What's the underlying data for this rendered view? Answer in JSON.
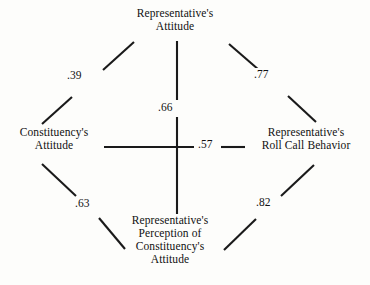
{
  "diagram": {
    "nodes": {
      "representative_attitude": {
        "id": "representative-attitude",
        "lines": [
          "Representative's",
          "Attitude"
        ]
      },
      "constituency_attitude": {
        "id": "constituency-attitude",
        "lines": [
          "Constituency's",
          "Attitude"
        ]
      },
      "roll_call_behavior": {
        "id": "roll-call-behavior",
        "lines": [
          "Representative's",
          "Roll Call Behavior"
        ]
      },
      "perception": {
        "id": "perception",
        "lines": [
          "Representative's",
          "Perception of",
          "Constituency's",
          "Attitude"
        ]
      }
    },
    "edges": [
      {
        "id": "edge-constituency-attitude-to-representative-attitude",
        "from": "constituency_attitude",
        "to": "representative_attitude",
        "value": ".39"
      },
      {
        "id": "edge-representative-attitude-to-roll-call",
        "from": "representative_attitude",
        "to": "roll_call_behavior",
        "value": ".77"
      },
      {
        "id": "edge-representative-attitude-to-perception",
        "from": "representative_attitude",
        "to": "perception",
        "value": ".66"
      },
      {
        "id": "edge-constituency-attitude-to-roll-call",
        "from": "constituency_attitude",
        "to": "roll_call_behavior",
        "value": ".57"
      },
      {
        "id": "edge-constituency-attitude-to-perception",
        "from": "constituency_attitude",
        "to": "perception",
        "value": ".63"
      },
      {
        "id": "edge-perception-to-roll-call",
        "from": "perception",
        "to": "roll_call_behavior",
        "value": ".82"
      }
    ],
    "colors": {
      "background": "#fdfdfb",
      "ink": "#111111",
      "line": "#1a1a1a"
    }
  }
}
